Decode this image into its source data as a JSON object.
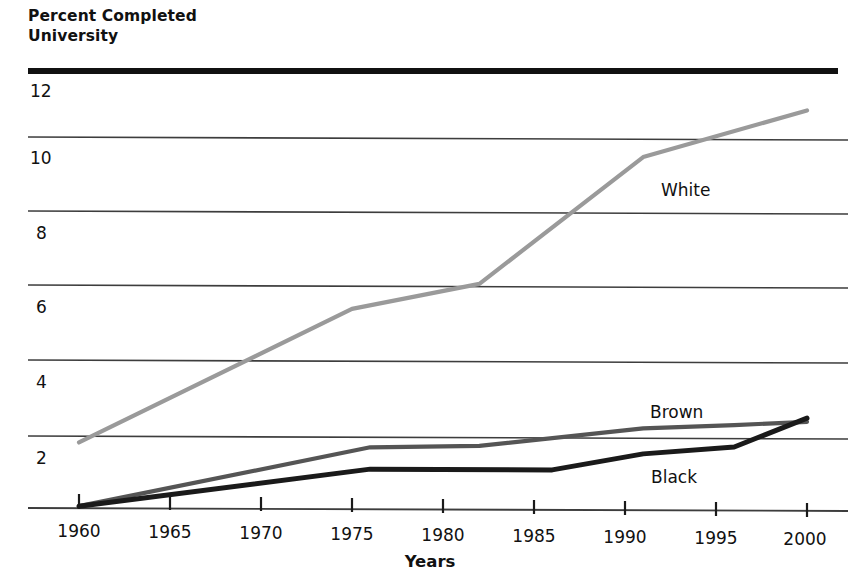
{
  "chart_data": {
    "type": "line",
    "title": "Percent Completed\nUniversity",
    "title_line1": "Percent Completed",
    "title_line2": "University",
    "xlabel": "Years",
    "ylabel": "",
    "xlim": [
      1960,
      2000
    ],
    "ylim": [
      0,
      12
    ],
    "grid": true,
    "grid_axis": "y",
    "legend_position": "inline-labels",
    "x_ticks": [
      1960,
      1965,
      1970,
      1975,
      1980,
      1985,
      1990,
      1995,
      2000
    ],
    "x_tick_labels": [
      "1960",
      "1965",
      "1970",
      "1975",
      "1980",
      "1985",
      "1990",
      "1995",
      "2000"
    ],
    "y_ticks": [
      2,
      4,
      6,
      8,
      10,
      12
    ],
    "y_tick_labels": [
      "2",
      "4",
      "6",
      "8",
      "10",
      "12"
    ],
    "colors": {
      "white_series": "#9a9a9a",
      "brown_series": "#555555",
      "black_series": "#1a1a1a",
      "gridline": "#3d3d3d",
      "top_rule": "#111111",
      "text": "#111111"
    },
    "series": [
      {
        "name": "White",
        "color": "#9a9a9a",
        "label_x": 1992,
        "label_y": 9.0,
        "x": [
          1960,
          1975,
          1982,
          1991,
          2000
        ],
        "values": [
          1.8,
          5.5,
          6.2,
          9.7,
          11.0
        ]
      },
      {
        "name": "Brown",
        "color": "#555555",
        "label_x": 1991,
        "label_y": 3.0,
        "x": [
          1960,
          1976,
          1982,
          1991,
          1996,
          2000
        ],
        "values": [
          0.05,
          1.7,
          1.75,
          2.25,
          2.35,
          2.45
        ]
      },
      {
        "name": "Black",
        "color": "#1a1a1a",
        "label_x": 1991,
        "label_y": 1.35,
        "x": [
          1960,
          1976,
          1986,
          1991,
          1996,
          2000
        ],
        "values": [
          0.05,
          1.1,
          1.1,
          1.55,
          1.75,
          2.55
        ]
      }
    ]
  },
  "axis": {
    "y_axis_name": "percent-completed-university",
    "x_axis_name": "years"
  }
}
